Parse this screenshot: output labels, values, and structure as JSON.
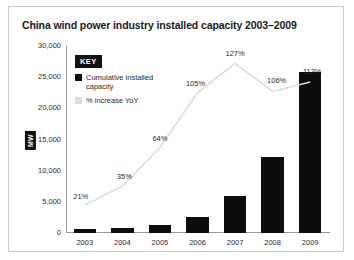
{
  "chart_data": {
    "type": "bar",
    "title": "China wind power industry installed capacity 2003–2009",
    "xlabel": "",
    "ylabel": "MW",
    "categories": [
      "2003",
      "2004",
      "2005",
      "2006",
      "2007",
      "2008",
      "2009"
    ],
    "ylim": [
      0,
      30000
    ],
    "yticks": [
      0,
      5000,
      10000,
      15000,
      20000,
      25000,
      30000
    ],
    "ytick_labels": [
      "0",
      "5,000",
      "10,000",
      "15,000",
      "20,000",
      "25,000",
      "30,000"
    ],
    "grid": false,
    "legend_position": "top-left",
    "series": [
      {
        "name": "Cumulative installed capacity",
        "type": "bar",
        "unit": "MW",
        "color": "#0d0d0d",
        "values": [
          570,
          770,
          1270,
          2600,
          5900,
          12200,
          25800
        ]
      },
      {
        "name": "% increase YoY",
        "type": "line",
        "unit": "%",
        "color": "#dcdcdc",
        "values": [
          21,
          35,
          64,
          105,
          127,
          106,
          113
        ],
        "data_labels": [
          "21%",
          "35%",
          "64%",
          "105%",
          "127%",
          "106%",
          "113%"
        ],
        "ylim": [
          0,
          140
        ]
      }
    ]
  },
  "legend": {
    "title": "KEY",
    "items": [
      {
        "label": "Cumulative installed capacity",
        "color": "#0d0d0d"
      },
      {
        "label": "% increase YoY",
        "color": "#dcdcdc"
      }
    ]
  }
}
